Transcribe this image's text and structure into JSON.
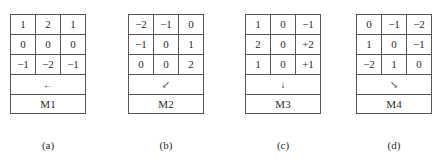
{
  "panels": [
    {
      "name": "M1",
      "caption": "(a)",
      "direction": "left",
      "arrow": "←",
      "matrix": [
        [
          "1",
          "2",
          "1"
        ],
        [
          "0",
          "0",
          "0"
        ],
        [
          "−1",
          "−2",
          "−1"
        ]
      ]
    },
    {
      "name": "M2",
      "caption": "(b)",
      "direction": "down-left",
      "arrow": "↙",
      "matrix": [
        [
          "−2",
          "−1",
          "0"
        ],
        [
          "−1",
          "0",
          "1"
        ],
        [
          "0",
          "0",
          "2"
        ]
      ]
    },
    {
      "name": "M3",
      "caption": "(c)",
      "direction": "down",
      "arrow": "↓",
      "matrix": [
        [
          "1",
          "0",
          "−1"
        ],
        [
          "2",
          "0",
          "+2"
        ],
        [
          "1",
          "0",
          "+1"
        ]
      ]
    },
    {
      "name": "M4",
      "caption": "(d)",
      "direction": "down-right",
      "arrow": "↘",
      "matrix": [
        [
          "0",
          "−1",
          "−2"
        ],
        [
          "1",
          "0",
          "−1"
        ],
        [
          "−2",
          "1",
          "0"
        ]
      ]
    }
  ],
  "figure_caption": ""
}
